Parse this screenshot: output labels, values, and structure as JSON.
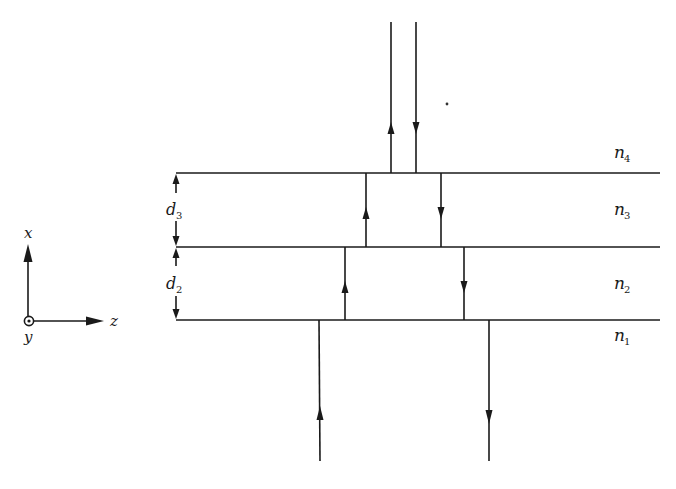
{
  "figure": {
    "type": "multilayer thin-film wave diagram",
    "colors": {
      "ink": "#1a1a1a",
      "background": "#ffffff"
    }
  },
  "axes": {
    "x_label": "x",
    "z_label": "z",
    "y_label": "y",
    "y_symbol": "out-of-page dot (⊙)"
  },
  "layers": [
    {
      "id": "n4",
      "label": "n",
      "sub": "4",
      "region": "top medium"
    },
    {
      "id": "n3",
      "label": "n",
      "sub": "3",
      "region": "layer",
      "thickness_label": "d",
      "thickness_sub": "3"
    },
    {
      "id": "n2",
      "label": "n",
      "sub": "2",
      "region": "layer",
      "thickness_label": "d",
      "thickness_sub": "2"
    },
    {
      "id": "n1",
      "label": "n",
      "sub": "1",
      "region": "substrate"
    }
  ],
  "rays": [
    {
      "region": "n4",
      "direction": "up"
    },
    {
      "region": "n4",
      "direction": "down"
    },
    {
      "region": "n3",
      "direction": "up"
    },
    {
      "region": "n3",
      "direction": "down"
    },
    {
      "region": "n2",
      "direction": "up"
    },
    {
      "region": "n2",
      "direction": "down"
    },
    {
      "region": "n1",
      "direction": "up"
    },
    {
      "region": "n1",
      "direction": "down"
    }
  ]
}
